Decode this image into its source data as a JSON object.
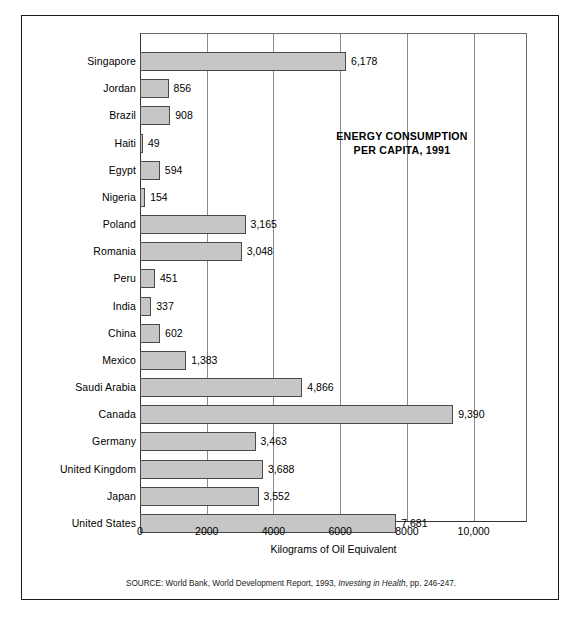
{
  "chart_data": {
    "type": "bar",
    "orientation": "horizontal",
    "title": "ENERGY CONSUMPTION PER CAPITA, 1991",
    "title_line1": "ENERGY CONSUMPTION",
    "title_line2": "PER CAPITA, 1991",
    "xlabel": "Kilograms of Oil Equivalent",
    "ylabel": "",
    "xlim": [
      0,
      11600
    ],
    "xticks": [
      0,
      2000,
      4000,
      6000,
      8000,
      10000
    ],
    "xtick_labels": [
      "0",
      "2000",
      "4000",
      "6000",
      "8000",
      "10,000"
    ],
    "grid": "vertical",
    "legend": "none",
    "bar_color": "#c6c6c6",
    "bar_edge_color": "#4a4a4a",
    "categories": [
      "Singapore",
      "Jordan",
      "Brazil",
      "Haiti",
      "Egypt",
      "Nigeria",
      "Poland",
      "Romania",
      "Peru",
      "India",
      "China",
      "Mexico",
      "Saudi Arabia",
      "Canada",
      "Germany",
      "United Kingdom",
      "Japan",
      "United States"
    ],
    "values": [
      6178,
      856,
      908,
      49,
      594,
      154,
      3165,
      3048,
      451,
      337,
      602,
      1383,
      4866,
      9390,
      3463,
      3688,
      3552,
      7681
    ],
    "value_labels": [
      "6,178",
      "856",
      "908",
      "49",
      "594",
      "154",
      "3,165",
      "3,048",
      "451",
      "337",
      "602",
      "1,383",
      "4,866",
      "9,390",
      "3,463",
      "3,688",
      "3,552",
      "7,681"
    ],
    "rows": [
      {
        "label": "Singapore",
        "value": 6178,
        "value_label": "6,178"
      },
      {
        "label": "Jordan",
        "value": 856,
        "value_label": "856"
      },
      {
        "label": "Brazil",
        "value": 908,
        "value_label": "908"
      },
      {
        "label": "Haiti",
        "value": 49,
        "value_label": "49"
      },
      {
        "label": "Egypt",
        "value": 594,
        "value_label": "594"
      },
      {
        "label": "Nigeria",
        "value": 154,
        "value_label": "154"
      },
      {
        "label": "Poland",
        "value": 3165,
        "value_label": "3,165"
      },
      {
        "label": "Romania",
        "value": 3048,
        "value_label": "3,048"
      },
      {
        "label": "Peru",
        "value": 451,
        "value_label": "451"
      },
      {
        "label": "India",
        "value": 337,
        "value_label": "337"
      },
      {
        "label": "China",
        "value": 602,
        "value_label": "602"
      },
      {
        "label": "Mexico",
        "value": 1383,
        "value_label": "1,383"
      },
      {
        "label": "Saudi Arabia",
        "value": 4866,
        "value_label": "4,866"
      },
      {
        "label": "Canada",
        "value": 9390,
        "value_label": "9,390"
      },
      {
        "label": "Germany",
        "value": 3463,
        "value_label": "3,463"
      },
      {
        "label": "United Kingdom",
        "value": 3688,
        "value_label": "3,688"
      },
      {
        "label": "Japan",
        "value": 3552,
        "value_label": "3,552"
      },
      {
        "label": "United States",
        "value": 7681,
        "value_label": "7,681"
      }
    ]
  },
  "source": {
    "prefix": "SOURCE:  World Bank, World Development Report, 1993, ",
    "italic": "Investing in Health",
    "suffix": ", pp.  246-247."
  }
}
